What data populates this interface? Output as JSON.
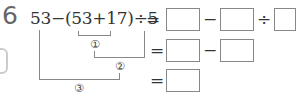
{
  "problem": {
    "number": "6",
    "expression": "53−(53+17)÷5",
    "rows": [
      {
        "equals": "=",
        "boxes": 3,
        "operators": [
          "−",
          "÷"
        ]
      },
      {
        "equals": "=",
        "boxes": 2,
        "operators": [
          "−"
        ]
      },
      {
        "equals": "=",
        "boxes": 1,
        "operators": []
      }
    ],
    "step_labels": [
      "①",
      "②",
      "③"
    ]
  }
}
